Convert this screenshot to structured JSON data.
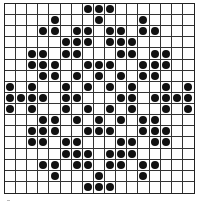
{
  "grid": {
    "rows": 17,
    "cols": 17,
    "dot_color": "#111111",
    "line_color": "#333333",
    "dots": [
      [
        7,
        8,
        9
      ],
      [
        4,
        8,
        12
      ],
      [
        3,
        4,
        6,
        7,
        9,
        10,
        12,
        13
      ],
      [
        5,
        6,
        7,
        9,
        10,
        11
      ],
      [
        2,
        3,
        5,
        6,
        10,
        11,
        13,
        14
      ],
      [
        2,
        3,
        4,
        7,
        8,
        9,
        12,
        13,
        14
      ],
      [
        3,
        4,
        6,
        8,
        10,
        12,
        13
      ],
      [
        0,
        2,
        5,
        7,
        9,
        11,
        14,
        16
      ],
      [
        0,
        1,
        2,
        3,
        5,
        6,
        10,
        11,
        13,
        14,
        15,
        16
      ],
      [
        0,
        2,
        5,
        7,
        9,
        11,
        14,
        16
      ],
      [
        3,
        4,
        6,
        8,
        10,
        12,
        13
      ],
      [
        2,
        3,
        4,
        7,
        8,
        9,
        12,
        13,
        14
      ],
      [
        2,
        3,
        5,
        6,
        10,
        11,
        13,
        14
      ],
      [
        5,
        6,
        7,
        9,
        10,
        11
      ],
      [
        3,
        4,
        6,
        7,
        9,
        10,
        12,
        13
      ],
      [
        4,
        8,
        12
      ],
      [
        7,
        8,
        9
      ]
    ]
  }
}
